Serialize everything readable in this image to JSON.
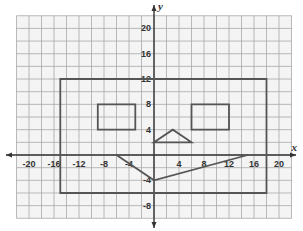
{
  "chart_data": {
    "type": "scatter",
    "title": "",
    "xlabel": "x",
    "ylabel": "y",
    "xlim": [
      -22,
      22
    ],
    "ylim": [
      -10,
      22
    ],
    "grid": true,
    "grid_step": 2,
    "x_ticks": [
      -20,
      -16,
      -12,
      -8,
      -4,
      4,
      8,
      12,
      16,
      20
    ],
    "y_ticks": [
      20,
      16,
      12,
      8,
      4,
      -4,
      -8
    ],
    "shapes": [
      {
        "name": "outer-rectangle",
        "type": "polygon",
        "points": [
          [
            -15,
            12
          ],
          [
            18,
            12
          ],
          [
            18,
            -6
          ],
          [
            -15,
            -6
          ]
        ]
      },
      {
        "name": "left-eye-rectangle",
        "type": "polygon",
        "points": [
          [
            -9,
            8
          ],
          [
            -3,
            8
          ],
          [
            -3,
            4
          ],
          [
            -9,
            4
          ]
        ]
      },
      {
        "name": "right-eye-rectangle",
        "type": "polygon",
        "points": [
          [
            6,
            8
          ],
          [
            12,
            8
          ],
          [
            12,
            4
          ],
          [
            6,
            4
          ]
        ]
      },
      {
        "name": "nose-triangle",
        "type": "polygon",
        "points": [
          [
            0,
            2
          ],
          [
            3,
            4
          ],
          [
            6,
            2
          ]
        ]
      },
      {
        "name": "mouth-polyline",
        "type": "polyline",
        "points": [
          [
            -6,
            0
          ],
          [
            0,
            -4
          ],
          [
            15,
            0
          ]
        ]
      }
    ],
    "colors": {
      "grid": "#a8a8a8",
      "axis": "#333333",
      "shape": "#555555",
      "background": "#f4f4f4"
    }
  }
}
